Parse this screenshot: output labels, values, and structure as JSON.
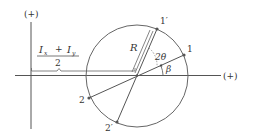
{
  "diagram": {
    "type": "mohr-circle",
    "colors": {
      "stroke": "#555555",
      "text": "#333333",
      "background": "#ffffff"
    },
    "axes": {
      "vertical_label": "(+)",
      "horizontal_label": "(+)"
    },
    "center_offset": {
      "numerator_left": "I",
      "numerator_left_sub": "x",
      "operator": "+",
      "numerator_right": "I",
      "numerator_right_sub": "y",
      "denominator": "2"
    },
    "circle": {
      "radius_label": "R",
      "double_angle_label": "2θ",
      "angle_label": "β"
    },
    "points": [
      {
        "id": "1",
        "label": "1"
      },
      {
        "id": "1p",
        "label": "1′"
      },
      {
        "id": "2",
        "label": "2"
      },
      {
        "id": "2p",
        "label": "2′"
      }
    ]
  }
}
